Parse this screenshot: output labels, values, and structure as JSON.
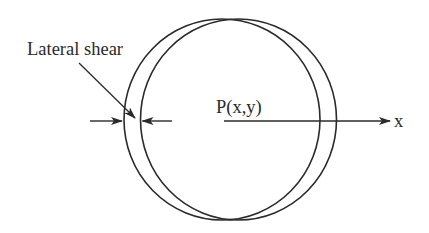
{
  "diagram": {
    "type": "lateral-shear-interferogram-schematic",
    "labels": {
      "shear": "Lateral shear",
      "point": "P(x,y)",
      "axis": "x"
    },
    "wavefronts": [
      {
        "name": "original-wavefront",
        "cx": 222,
        "cy": 119.5,
        "rx": 98,
        "ry": 100.5
      },
      {
        "name": "sheared-wavefront",
        "cx": 238.5,
        "cy": 119.5,
        "rx": 98,
        "ry": 100.5
      }
    ],
    "colors": {
      "line": "#2a2a2a",
      "background": "#ffffff"
    }
  }
}
